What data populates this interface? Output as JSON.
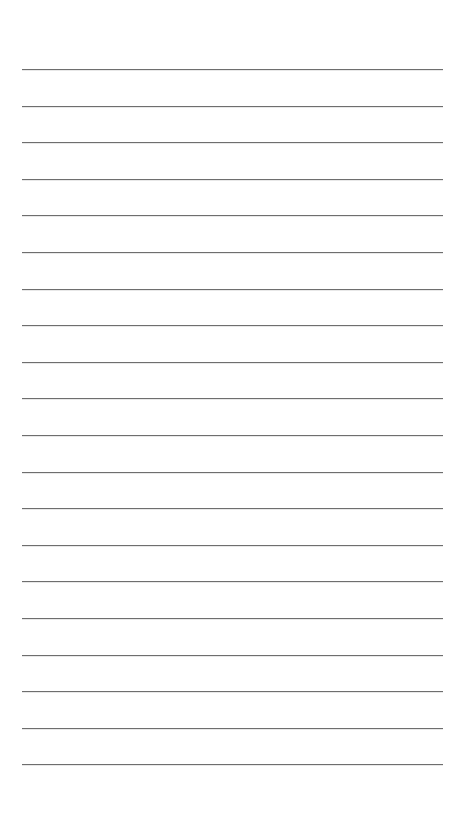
{
  "page": {
    "type": "lined-paper",
    "background": "#ffffff",
    "line_color": "#6e6e6e",
    "line_count": 20,
    "first_line_y": 69,
    "line_spacing": 36.6,
    "line_left": 22,
    "line_right": 443,
    "text": ""
  }
}
